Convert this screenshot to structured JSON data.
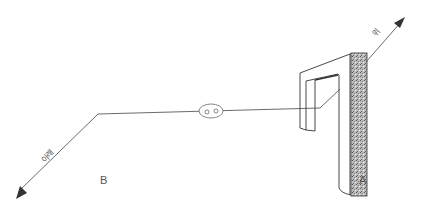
{
  "diagram": {
    "labels": {
      "point_a": "A",
      "point_b": "B",
      "up": "위",
      "down": "아래"
    },
    "colors": {
      "line": "#444444",
      "speckle": "#9a9a9a",
      "background": "#ffffff"
    }
  }
}
